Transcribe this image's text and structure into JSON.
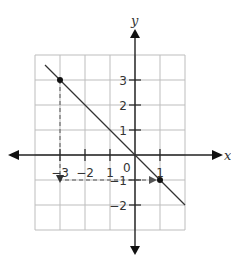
{
  "chart_data": {
    "type": "line",
    "title": "",
    "xlabel": "x",
    "ylabel": "y",
    "xlim": [
      -4,
      2
    ],
    "ylim": [
      -3,
      4
    ],
    "grid": true,
    "x_tick_labels": [
      {
        "value": -3,
        "text": "−3"
      },
      {
        "value": -2,
        "text": "−2"
      },
      {
        "value": -1,
        "text": "1"
      },
      {
        "value": 1,
        "text": "1"
      }
    ],
    "y_tick_labels": [
      {
        "value": 3,
        "text": "3"
      },
      {
        "value": 2,
        "text": "2"
      },
      {
        "value": 1,
        "text": "1"
      },
      {
        "value": -1,
        "text": "−1"
      },
      {
        "value": -2,
        "text": "−2"
      }
    ],
    "origin_label": "0",
    "series": [
      {
        "name": "y = -x",
        "x": [
          -3.6,
          2
        ],
        "y": [
          3.6,
          -2
        ]
      }
    ],
    "points": [
      {
        "x": -3,
        "y": 3
      },
      {
        "x": 1,
        "y": -1
      }
    ],
    "mapping_arrow": {
      "from": [
        -3,
        3
      ],
      "via": [
        -3,
        -1
      ],
      "to": [
        1,
        -1
      ]
    }
  }
}
